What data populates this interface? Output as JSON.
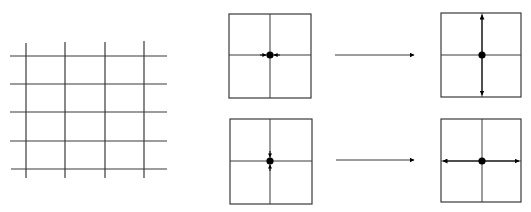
{
  "diagram": {
    "width": 531,
    "height": 212,
    "colors": {
      "line": "#3a3a3a",
      "dot": "#000000",
      "background": "#ffffff"
    },
    "grid": {
      "h_lines": [
        {
          "y": 56,
          "x1": 10,
          "x2": 167
        },
        {
          "y": 84,
          "x1": 10,
          "x2": 167
        },
        {
          "y": 112,
          "x1": 10,
          "x2": 167
        },
        {
          "y": 141,
          "x1": 10,
          "x2": 167
        },
        {
          "y": 169,
          "x1": 11,
          "x2": 167
        }
      ],
      "v_lines": [
        {
          "x": 26,
          "y1": 43,
          "y2": 178
        },
        {
          "x": 65,
          "y1": 42,
          "y2": 178
        },
        {
          "x": 105,
          "y1": 42,
          "y2": 178
        },
        {
          "x": 144,
          "y1": 41,
          "y2": 178
        }
      ]
    },
    "panels": [
      {
        "id": "top-left",
        "box": {
          "x": 229,
          "y": 14,
          "w": 82,
          "h": 84
        },
        "center": {
          "x": 270,
          "y": 55
        },
        "arrows": "horizontal-inward"
      },
      {
        "id": "top-right",
        "box": {
          "x": 441,
          "y": 13,
          "w": 80,
          "h": 84
        },
        "center": {
          "x": 482,
          "y": 55
        },
        "arrows": "vertical-outward"
      },
      {
        "id": "bottom-left",
        "box": {
          "x": 230,
          "y": 119,
          "w": 82,
          "h": 85
        },
        "center": {
          "x": 270,
          "y": 161
        },
        "arrows": "vertical-inward"
      },
      {
        "id": "bottom-right",
        "box": {
          "x": 441,
          "y": 119,
          "w": 80,
          "h": 83
        },
        "center": {
          "x": 482,
          "y": 161
        },
        "arrows": "horizontal-outward"
      }
    ],
    "transitions": [
      {
        "id": "top",
        "x1": 335,
        "x2": 414,
        "y": 55
      },
      {
        "id": "bottom",
        "x1": 336,
        "x2": 414,
        "y": 160
      }
    ]
  }
}
